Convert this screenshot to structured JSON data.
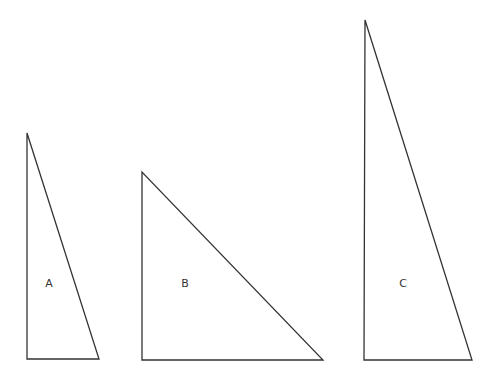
{
  "diagram": {
    "stroke_color": "#333333",
    "background": "#ffffff",
    "triangles": [
      {
        "label": "A",
        "points": [
          [
            27,
            133
          ],
          [
            27,
            359
          ],
          [
            99,
            359
          ]
        ],
        "label_pos": [
          49,
          287
        ]
      },
      {
        "label": "B",
        "points": [
          [
            142,
            172
          ],
          [
            142,
            360
          ],
          [
            323,
            360
          ]
        ],
        "label_pos": [
          185,
          287
        ]
      },
      {
        "label": "C",
        "points": [
          [
            365,
            20
          ],
          [
            364,
            360
          ],
          [
            472,
            360
          ]
        ],
        "label_pos": [
          403,
          287
        ]
      }
    ]
  }
}
